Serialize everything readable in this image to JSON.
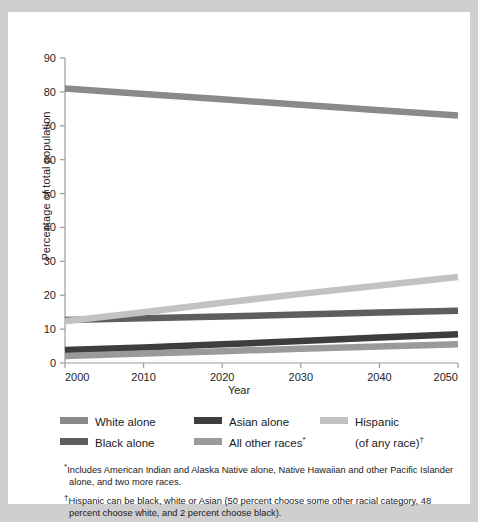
{
  "chart_data": {
    "type": "line",
    "title": "",
    "xlabel": "Year",
    "ylabel": "Percentage of total population",
    "x": [
      2000,
      2010,
      2020,
      2030,
      2040,
      2050
    ],
    "xlim": [
      2000,
      2050
    ],
    "ylim": [
      0,
      90
    ],
    "yticks": [
      0,
      10,
      20,
      30,
      40,
      50,
      60,
      70,
      80,
      90
    ],
    "xticks": [
      "2000",
      "2010",
      "2020",
      "2030",
      "2040",
      "2050"
    ],
    "grid": false,
    "legend_position": "below",
    "series": [
      {
        "name": "White alone",
        "color": "#8a8a8a",
        "values": [
          81.0,
          79.4,
          77.8,
          76.2,
          74.6,
          73.0
        ]
      },
      {
        "name": "Black alone",
        "color": "#5e5e5e",
        "values": [
          12.7,
          13.2,
          13.7,
          14.3,
          14.9,
          15.4
        ]
      },
      {
        "name": "Asian alone",
        "color": "#3d3d3d",
        "values": [
          3.8,
          4.6,
          5.5,
          6.5,
          7.5,
          8.5
        ]
      },
      {
        "name": "All other races*",
        "color": "#9a9a9a",
        "values": [
          2.1,
          2.8,
          3.5,
          4.2,
          4.9,
          5.5
        ]
      },
      {
        "name": "Hispanic (of any race)†",
        "color": "#c2c2c2",
        "values": [
          12.3,
          15.0,
          17.8,
          20.4,
          22.9,
          25.4
        ]
      }
    ]
  },
  "axes": {
    "ylabel": "Percentage of total population",
    "xlabel": "Year",
    "yticks": [
      "90",
      "80",
      "70",
      "60",
      "50",
      "40",
      "30",
      "20",
      "10",
      "0"
    ],
    "xticks": [
      "2000",
      "2010",
      "2020",
      "2030",
      "2040",
      "2050"
    ]
  },
  "legend": {
    "columns": [
      {
        "items": [
          {
            "label": "White alone",
            "sublabel": "",
            "marker": "",
            "color": "#8a8a8a"
          },
          {
            "label": "Black alone",
            "sublabel": "",
            "marker": "",
            "color": "#5e5e5e"
          }
        ]
      },
      {
        "items": [
          {
            "label": "Asian alone",
            "sublabel": "",
            "marker": "",
            "color": "#3d3d3d"
          },
          {
            "label": "All other races",
            "sublabel": "",
            "marker": "*",
            "color": "#9a9a9a"
          }
        ]
      },
      {
        "items": [
          {
            "label": "Hispanic",
            "sublabel": "(of any race)",
            "marker": "†",
            "color": "#c2c2c2"
          }
        ]
      }
    ]
  },
  "notes": [
    {
      "marker": "*",
      "text": "Includes American Indian and Alaska Native alone, Native Hawaiian and other Pacific Islander alone, and two more races."
    },
    {
      "marker": "†",
      "text": "Hispanic can be black, white or Asian (50 percent choose some other racial category, 48 percent choose white, and 2 percent choose black)."
    }
  ],
  "colors": {
    "page_background": "#cfcfcf",
    "card_background": "#ffffff",
    "axis": "#9b9b9b",
    "text": "#1a1a1a"
  }
}
